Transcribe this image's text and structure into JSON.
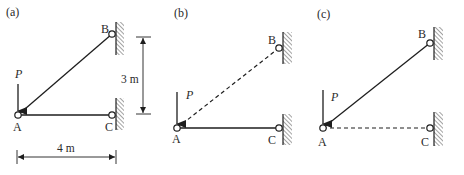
{
  "panels": [
    {
      "id": "a",
      "label": "(a)",
      "nodes": {
        "A": "A",
        "B": "B",
        "C": "C"
      },
      "load": "P",
      "members": {
        "AB": "solid",
        "AC": "solid"
      },
      "dimensions": {
        "vertical": "3 m",
        "horizontal": "4 m"
      }
    },
    {
      "id": "b",
      "label": "(b)",
      "nodes": {
        "A": "A",
        "B": "B",
        "C": "C"
      },
      "load": "P",
      "members": {
        "AB": "dashed",
        "AC": "solid"
      }
    },
    {
      "id": "c",
      "label": "(c)",
      "nodes": {
        "A": "A",
        "B": "B",
        "C": "C"
      },
      "load": "P",
      "members": {
        "AB": "solid",
        "AC": "dashed"
      }
    }
  ],
  "colors": {
    "line": "#1e1e1e",
    "hatch": "#555555",
    "background": "#ffffff"
  }
}
